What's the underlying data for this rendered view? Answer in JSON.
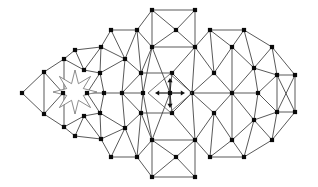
{
  "figure": {
    "kind": "mesh-diagram",
    "width": 318,
    "height": 187,
    "background_color": "#ffffff",
    "edge_color": "#3b3b3b",
    "node_color": "#0a0a0a",
    "hole_outline_color": "#6f6f6f",
    "marker_color": "#101010",
    "node_size": 2.1,
    "edge_width": 0.85
  },
  "chart_data": {
    "type": "scatter",
    "xlabel": "",
    "ylabel": "",
    "xlim": [
      0,
      318
    ],
    "ylim": [
      0,
      187
    ],
    "grid": false,
    "legend": "none",
    "nodes": [
      [
        22,
        93
      ],
      [
        44,
        72
      ],
      [
        44,
        114
      ],
      [
        64,
        59
      ],
      [
        64,
        127
      ],
      [
        63,
        93
      ],
      [
        87,
        93
      ],
      [
        84,
        70
      ],
      [
        84,
        116
      ],
      [
        75,
        50
      ],
      [
        75,
        136
      ],
      [
        101,
        47
      ],
      [
        101,
        139
      ],
      [
        100,
        73
      ],
      [
        100,
        113
      ],
      [
        104,
        93
      ],
      [
        111,
        30
      ],
      [
        111,
        157
      ],
      [
        125,
        59
      ],
      [
        125,
        128
      ],
      [
        122,
        93
      ],
      [
        137,
        30
      ],
      [
        137,
        157
      ],
      [
        141,
        73
      ],
      [
        141,
        113
      ],
      [
        152,
        10
      ],
      [
        152,
        177
      ],
      [
        152,
        47
      ],
      [
        152,
        140
      ],
      [
        143,
        93
      ],
      [
        170,
        93
      ],
      [
        172,
        73
      ],
      [
        172,
        113
      ],
      [
        176,
        30
      ],
      [
        176,
        157
      ],
      [
        195,
        10
      ],
      [
        195,
        177
      ],
      [
        195,
        47
      ],
      [
        195,
        140
      ],
      [
        192,
        93
      ],
      [
        210,
        30
      ],
      [
        210,
        157
      ],
      [
        214,
        73
      ],
      [
        214,
        113
      ],
      [
        232,
        47
      ],
      [
        232,
        140
      ],
      [
        232,
        93
      ],
      [
        244,
        30
      ],
      [
        244,
        157
      ],
      [
        254,
        68
      ],
      [
        254,
        120
      ],
      [
        258,
        93
      ],
      [
        272,
        47
      ],
      [
        272,
        140
      ],
      [
        277,
        75
      ],
      [
        277,
        112
      ],
      [
        295,
        75
      ],
      [
        295,
        112
      ]
    ],
    "edges": [
      [
        [
          22,
          93
        ],
        [
          44,
          72
        ]
      ],
      [
        [
          22,
          93
        ],
        [
          44,
          114
        ]
      ],
      [
        [
          44,
          72
        ],
        [
          44,
          114
        ]
      ],
      [
        [
          44,
          72
        ],
        [
          64,
          59
        ]
      ],
      [
        [
          44,
          114
        ],
        [
          64,
          127
        ]
      ],
      [
        [
          44,
          72
        ],
        [
          63,
          93
        ]
      ],
      [
        [
          44,
          114
        ],
        [
          63,
          93
        ]
      ],
      [
        [
          64,
          59
        ],
        [
          64,
          127
        ]
      ],
      [
        [
          64,
          59
        ],
        [
          75,
          50
        ]
      ],
      [
        [
          64,
          127
        ],
        [
          75,
          136
        ]
      ],
      [
        [
          64,
          59
        ],
        [
          84,
          70
        ]
      ],
      [
        [
          64,
          127
        ],
        [
          84,
          116
        ]
      ],
      [
        [
          75,
          50
        ],
        [
          101,
          47
        ]
      ],
      [
        [
          75,
          136
        ],
        [
          101,
          139
        ]
      ],
      [
        [
          75,
          50
        ],
        [
          84,
          70
        ]
      ],
      [
        [
          75,
          136
        ],
        [
          84,
          116
        ]
      ],
      [
        [
          84,
          70
        ],
        [
          100,
          73
        ]
      ],
      [
        [
          84,
          116
        ],
        [
          100,
          113
        ]
      ],
      [
        [
          84,
          70
        ],
        [
          101,
          47
        ]
      ],
      [
        [
          84,
          116
        ],
        [
          101,
          139
        ]
      ],
      [
        [
          87,
          93
        ],
        [
          100,
          73
        ]
      ],
      [
        [
          87,
          93
        ],
        [
          100,
          113
        ]
      ],
      [
        [
          87,
          93
        ],
        [
          104,
          93
        ]
      ],
      [
        [
          101,
          47
        ],
        [
          100,
          73
        ]
      ],
      [
        [
          101,
          139
        ],
        [
          100,
          113
        ]
      ],
      [
        [
          101,
          47
        ],
        [
          111,
          30
        ]
      ],
      [
        [
          101,
          139
        ],
        [
          111,
          157
        ]
      ],
      [
        [
          101,
          47
        ],
        [
          125,
          59
        ]
      ],
      [
        [
          101,
          139
        ],
        [
          125,
          128
        ]
      ],
      [
        [
          100,
          73
        ],
        [
          104,
          93
        ]
      ],
      [
        [
          100,
          113
        ],
        [
          104,
          93
        ]
      ],
      [
        [
          100,
          73
        ],
        [
          125,
          59
        ]
      ],
      [
        [
          100,
          113
        ],
        [
          125,
          128
        ]
      ],
      [
        [
          104,
          93
        ],
        [
          122,
          93
        ]
      ],
      [
        [
          111,
          30
        ],
        [
          137,
          30
        ]
      ],
      [
        [
          111,
          157
        ],
        [
          137,
          157
        ]
      ],
      [
        [
          111,
          30
        ],
        [
          125,
          59
        ]
      ],
      [
        [
          111,
          157
        ],
        [
          125,
          128
        ]
      ],
      [
        [
          125,
          59
        ],
        [
          137,
          30
        ]
      ],
      [
        [
          125,
          128
        ],
        [
          137,
          157
        ]
      ],
      [
        [
          125,
          59
        ],
        [
          141,
          73
        ]
      ],
      [
        [
          125,
          128
        ],
        [
          141,
          113
        ]
      ],
      [
        [
          125,
          59
        ],
        [
          122,
          93
        ]
      ],
      [
        [
          125,
          128
        ],
        [
          122,
          93
        ]
      ],
      [
        [
          122,
          93
        ],
        [
          141,
          73
        ]
      ],
      [
        [
          122,
          93
        ],
        [
          141,
          113
        ]
      ],
      [
        [
          122,
          93
        ],
        [
          143,
          93
        ]
      ],
      [
        [
          137,
          30
        ],
        [
          152,
          47
        ]
      ],
      [
        [
          137,
          157
        ],
        [
          152,
          140
        ]
      ],
      [
        [
          137,
          30
        ],
        [
          152,
          10
        ]
      ],
      [
        [
          137,
          157
        ],
        [
          152,
          177
        ]
      ],
      [
        [
          137,
          30
        ],
        [
          141,
          73
        ]
      ],
      [
        [
          137,
          157
        ],
        [
          141,
          113
        ]
      ],
      [
        [
          141,
          73
        ],
        [
          152,
          47
        ]
      ],
      [
        [
          141,
          113
        ],
        [
          152,
          140
        ]
      ],
      [
        [
          141,
          73
        ],
        [
          143,
          93
        ]
      ],
      [
        [
          141,
          113
        ],
        [
          143,
          93
        ]
      ],
      [
        [
          141,
          73
        ],
        [
          172,
          73
        ]
      ],
      [
        [
          141,
          113
        ],
        [
          172,
          113
        ]
      ],
      [
        [
          152,
          10
        ],
        [
          195,
          10
        ]
      ],
      [
        [
          152,
          177
        ],
        [
          195,
          177
        ]
      ],
      [
        [
          152,
          10
        ],
        [
          152,
          47
        ]
      ],
      [
        [
          152,
          177
        ],
        [
          152,
          140
        ]
      ],
      [
        [
          152,
          47
        ],
        [
          176,
          30
        ]
      ],
      [
        [
          152,
          140
        ],
        [
          176,
          157
        ]
      ],
      [
        [
          152,
          47
        ],
        [
          195,
          47
        ]
      ],
      [
        [
          152,
          140
        ],
        [
          195,
          140
        ]
      ],
      [
        [
          152,
          47
        ],
        [
          170,
          93
        ]
      ],
      [
        [
          152,
          140
        ],
        [
          170,
          93
        ]
      ],
      [
        [
          143,
          93
        ],
        [
          152,
          47
        ]
      ],
      [
        [
          143,
          93
        ],
        [
          152,
          140
        ]
      ],
      [
        [
          176,
          30
        ],
        [
          195,
          10
        ]
      ],
      [
        [
          176,
          157
        ],
        [
          195,
          177
        ]
      ],
      [
        [
          176,
          30
        ],
        [
          152,
          10
        ]
      ],
      [
        [
          176,
          157
        ],
        [
          152,
          177
        ]
      ],
      [
        [
          176,
          30
        ],
        [
          195,
          47
        ]
      ],
      [
        [
          176,
          157
        ],
        [
          195,
          140
        ]
      ],
      [
        [
          195,
          10
        ],
        [
          195,
          47
        ]
      ],
      [
        [
          195,
          177
        ],
        [
          195,
          140
        ]
      ],
      [
        [
          195,
          47
        ],
        [
          210,
          30
        ]
      ],
      [
        [
          195,
          140
        ],
        [
          210,
          157
        ]
      ],
      [
        [
          195,
          47
        ],
        [
          192,
          93
        ]
      ],
      [
        [
          195,
          140
        ],
        [
          192,
          93
        ]
      ],
      [
        [
          195,
          47
        ],
        [
          214,
          73
        ]
      ],
      [
        [
          195,
          140
        ],
        [
          214,
          113
        ]
      ],
      [
        [
          172,
          73
        ],
        [
          192,
          93
        ]
      ],
      [
        [
          172,
          113
        ],
        [
          192,
          93
        ]
      ],
      [
        [
          172,
          73
        ],
        [
          195,
          47
        ]
      ],
      [
        [
          172,
          113
        ],
        [
          195,
          140
        ]
      ],
      [
        [
          170,
          93
        ],
        [
          172,
          73
        ]
      ],
      [
        [
          170,
          93
        ],
        [
          172,
          113
        ]
      ],
      [
        [
          192,
          93
        ],
        [
          214,
          73
        ]
      ],
      [
        [
          192,
          93
        ],
        [
          214,
          113
        ]
      ],
      [
        [
          192,
          93
        ],
        [
          232,
          93
        ]
      ],
      [
        [
          210,
          30
        ],
        [
          244,
          30
        ]
      ],
      [
        [
          210,
          157
        ],
        [
          244,
          157
        ]
      ],
      [
        [
          210,
          30
        ],
        [
          232,
          47
        ]
      ],
      [
        [
          210,
          157
        ],
        [
          232,
          140
        ]
      ],
      [
        [
          210,
          30
        ],
        [
          214,
          73
        ]
      ],
      [
        [
          210,
          157
        ],
        [
          214,
          113
        ]
      ],
      [
        [
          214,
          73
        ],
        [
          232,
          47
        ]
      ],
      [
        [
          214,
          113
        ],
        [
          232,
          140
        ]
      ],
      [
        [
          214,
          73
        ],
        [
          232,
          93
        ]
      ],
      [
        [
          214,
          113
        ],
        [
          232,
          93
        ]
      ],
      [
        [
          232,
          47
        ],
        [
          232,
          93
        ]
      ],
      [
        [
          232,
          140
        ],
        [
          232,
          93
        ]
      ],
      [
        [
          232,
          47
        ],
        [
          244,
          30
        ]
      ],
      [
        [
          232,
          140
        ],
        [
          244,
          157
        ]
      ],
      [
        [
          232,
          47
        ],
        [
          254,
          68
        ]
      ],
      [
        [
          232,
          140
        ],
        [
          254,
          120
        ]
      ],
      [
        [
          232,
          93
        ],
        [
          254,
          68
        ]
      ],
      [
        [
          232,
          93
        ],
        [
          254,
          120
        ]
      ],
      [
        [
          232,
          93
        ],
        [
          258,
          93
        ]
      ],
      [
        [
          244,
          30
        ],
        [
          272,
          47
        ]
      ],
      [
        [
          244,
          157
        ],
        [
          272,
          140
        ]
      ],
      [
        [
          244,
          30
        ],
        [
          254,
          68
        ]
      ],
      [
        [
          244,
          157
        ],
        [
          254,
          120
        ]
      ],
      [
        [
          254,
          68
        ],
        [
          272,
          47
        ]
      ],
      [
        [
          254,
          120
        ],
        [
          272,
          140
        ]
      ],
      [
        [
          254,
          68
        ],
        [
          277,
          75
        ]
      ],
      [
        [
          254,
          120
        ],
        [
          277,
          112
        ]
      ],
      [
        [
          258,
          93
        ],
        [
          254,
          68
        ]
      ],
      [
        [
          258,
          93
        ],
        [
          254,
          120
        ]
      ],
      [
        [
          258,
          93
        ],
        [
          277,
          75
        ]
      ],
      [
        [
          258,
          93
        ],
        [
          277,
          112
        ]
      ],
      [
        [
          272,
          47
        ],
        [
          277,
          75
        ]
      ],
      [
        [
          272,
          140
        ],
        [
          277,
          112
        ]
      ],
      [
        [
          272,
          47
        ],
        [
          295,
          75
        ]
      ],
      [
        [
          272,
          140
        ],
        [
          295,
          112
        ]
      ],
      [
        [
          277,
          75
        ],
        [
          277,
          112
        ]
      ],
      [
        [
          277,
          75
        ],
        [
          295,
          75
        ]
      ],
      [
        [
          277,
          112
        ],
        [
          295,
          112
        ]
      ],
      [
        [
          277,
          75
        ],
        [
          295,
          112
        ]
      ],
      [
        [
          277,
          112
        ],
        [
          295,
          75
        ]
      ],
      [
        [
          295,
          75
        ],
        [
          295,
          112
        ]
      ]
    ],
    "hole": {
      "name": "eight-pointed-star-void",
      "center": [
        75,
        92
      ],
      "outer_radius": 22,
      "inner_radius": 9,
      "points": 8,
      "rotation_deg": 0
    },
    "center_marker": {
      "name": "displacement-marker",
      "center": [
        170,
        93
      ],
      "diamond_half_width": 22,
      "diamond_half_height": 19,
      "arrow_directions": [
        "up",
        "down",
        "left",
        "right"
      ],
      "arrow_length": 15
    }
  }
}
